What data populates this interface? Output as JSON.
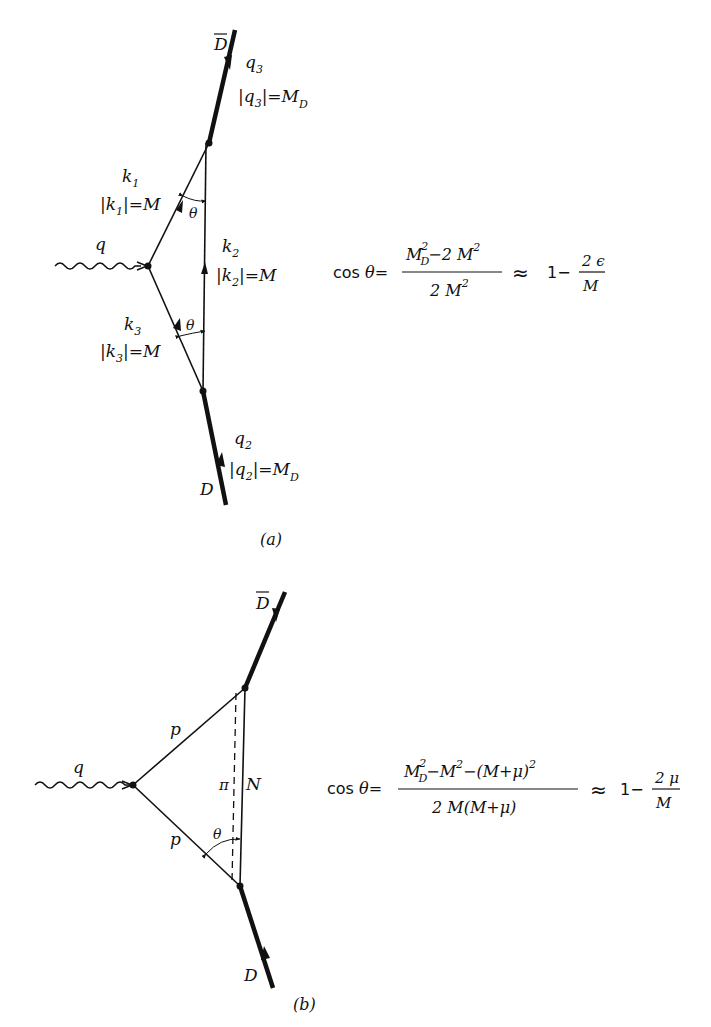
{
  "figure_a": {
    "caption": "(a)",
    "labels": {
      "dbar": "D",
      "q3": "q",
      "q3_sub": "3",
      "q3_mag": "|q",
      "q3_mag_sub": "3",
      "q3_mag_rhs": "|=M",
      "q3_mag_rhs_sub": "D",
      "k1": "k",
      "k1_sub": "1",
      "k1_mag": "|k",
      "k1_mag_sub": "1",
      "k1_mag_rhs": "|=M",
      "theta_top": "θ",
      "k2": "k",
      "k2_sub": "2",
      "k2_mag": "|k",
      "k2_mag_sub": "2",
      "k2_mag_rhs": "|=M",
      "q": "q",
      "k3": "k",
      "k3_sub": "3",
      "k3_mag": "|k",
      "k3_mag_sub": "3",
      "k3_mag_rhs": "|=M",
      "theta_bottom": "θ",
      "q2": "q",
      "q2_sub": "2",
      "q2_mag": "|q",
      "q2_mag_sub": "2",
      "q2_mag_rhs": "|=M",
      "q2_mag_rhs_sub": "D",
      "d": "D"
    },
    "equation": {
      "lhs": "cos θ=",
      "numerator": "M_D^2 − 2M^2",
      "num_part1": "M",
      "num_part1_sub": "D",
      "num_part1_sup": "2",
      "num_part2": "−2 M",
      "num_part2_sup": "2",
      "denominator": "2 M",
      "denominator_sup": "2",
      "approx": "≈",
      "rhs_one": "1−",
      "rhs_num": "2 ϵ",
      "rhs_den": "M"
    }
  },
  "figure_b": {
    "caption": "(b)",
    "labels": {
      "dbar": "D",
      "p_upper": "p",
      "p_lower": "p",
      "q": "q",
      "pi": "π",
      "n": "N",
      "theta": "θ",
      "d": "D"
    },
    "equation": {
      "lhs": "cos θ=",
      "num_part1": "M",
      "num_part1_sub": "D",
      "num_part1_sup": "2",
      "num_part2": "−M",
      "num_part2_sup": "2",
      "num_part3": "−(M+μ)",
      "num_part3_sup": "2",
      "denominator": "2 M(M+μ)",
      "approx": "≈",
      "rhs_one": "1−",
      "rhs_num": "2 μ",
      "rhs_den": "M"
    }
  },
  "colors": {
    "ink": "#111111",
    "background": "#ffffff"
  }
}
